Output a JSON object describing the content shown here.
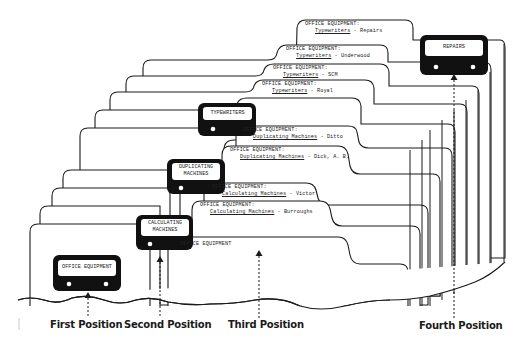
{
  "diagram": {
    "type": "filing-system-illustration"
  },
  "guides": [
    {
      "id": "g1",
      "label": "OFFICE EQUIPMENT",
      "position": "first"
    },
    {
      "id": "g2",
      "label": "CALCULATING MACHINES",
      "line1": "CALCULATING",
      "line2": "MACHINES",
      "position": "second"
    },
    {
      "id": "g3",
      "label": "DUPLICATING MACHINES",
      "line1": "DUPLICATING",
      "line2": "MACHINES",
      "position": "second"
    },
    {
      "id": "g4",
      "label": "TYPEWRITERS",
      "position": "second"
    },
    {
      "id": "g5",
      "label": "REPAIRS",
      "position": "fourth"
    }
  ],
  "folders": [
    {
      "heading": "OFFICE EQUIPMENT:",
      "category": "Typewriters",
      "item": "Repairs"
    },
    {
      "heading": "OFFICE EQUIPMENT:",
      "category": "Typewriters",
      "item": "Underwood"
    },
    {
      "heading": "OFFICE EQUIPMENT:",
      "category": "Typewriters",
      "item": "SCM"
    },
    {
      "heading": "OFFICE EQUIPMENT:",
      "category": "Typewriters",
      "item": "Royal"
    },
    {
      "heading": "OFFICE EQUIPMENT:",
      "category": "Duplicating Machines",
      "item": "Ditto"
    },
    {
      "heading": "OFFICE EQUIPMENT:",
      "category": "Duplicating Machines",
      "item": "Dick, A. B."
    },
    {
      "heading": "OFFICE EQUIPMENT:",
      "category": "Calculating Machines",
      "item": "Victor"
    },
    {
      "heading": "OFFICE EQUIPMENT:",
      "category": "Calculating Machines",
      "item": "Burroughs"
    },
    {
      "heading": "OFFICE EQUIPMENT",
      "category": "",
      "item": ""
    }
  ],
  "separator": " - ",
  "positions": [
    {
      "label": "First Position"
    },
    {
      "label": "Second Position"
    },
    {
      "label": "Third Position"
    },
    {
      "label": "Fourth Position"
    }
  ],
  "colors": {
    "line": "#1a1a1a",
    "guide_fill": "#111111",
    "paper": "#ffffff"
  }
}
